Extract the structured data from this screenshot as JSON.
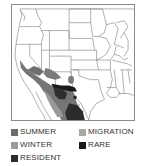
{
  "map": {
    "region": "Western / Central United States and northern Mexico",
    "ranges": [
      {
        "type": "summer",
        "color": "#6e6e6e",
        "area": "Southern California east through Nevada, Arizona, southern New Mexico"
      },
      {
        "type": "resident",
        "color": "#2e2e2e",
        "area": "Southern Arizona / New Mexico border and western Mexico"
      },
      {
        "type": "rare",
        "color": "#1e1e1e",
        "area": "Southern New Mexico band"
      },
      {
        "type": "winter",
        "color": "#9a9a9a",
        "area": "Northwestern Mexico"
      }
    ]
  },
  "legend": {
    "items": [
      {
        "key": "summer",
        "label": "SUMMER",
        "color": "#6b6b6b"
      },
      {
        "key": "migration",
        "label": "MIGRATION",
        "color": "#a8a8a8"
      },
      {
        "key": "winter",
        "label": "WINTER",
        "color": "#9c9c9c"
      },
      {
        "key": "rare",
        "label": "RARE",
        "color": "#1a1a1a"
      },
      {
        "key": "resident",
        "label": "RESIDENT",
        "color": "#2b2b2b"
      }
    ]
  }
}
